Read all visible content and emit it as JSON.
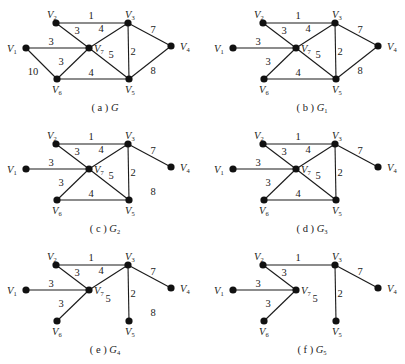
{
  "figure": {
    "vertices_local": {
      "V1": [
        26,
        48
      ],
      "V2": [
        56,
        23
      ],
      "V3": [
        128,
        23
      ],
      "V4": [
        171,
        46
      ],
      "V5": [
        129,
        79
      ],
      "V6": [
        57,
        79
      ],
      "V7": [
        89,
        48
      ]
    },
    "vertex_labels": {
      "V1": {
        "main": "V",
        "sub": "1",
        "dx": -19,
        "dy": 4
      },
      "V2": {
        "main": "V",
        "sub": "2",
        "dx": -9,
        "dy": -5
      },
      "V3": {
        "main": "V",
        "sub": "3",
        "dx": -3,
        "dy": -5
      },
      "V4": {
        "main": "V",
        "sub": "4",
        "dx": 9,
        "dy": 4
      },
      "V5": {
        "main": "V",
        "sub": "5",
        "dx": -4,
        "dy": 14
      },
      "V6": {
        "main": "V",
        "sub": "6",
        "dx": -5,
        "dy": 14
      },
      "V7": {
        "main": "V",
        "sub": "7",
        "dx": 5,
        "dy": 4
      }
    },
    "panels": [
      {
        "id": "a",
        "caption_prefix": "( a ) ",
        "caption_name": "G",
        "caption_sub": "",
        "offset": [
          0,
          0
        ],
        "caption_pos": [
          105,
          111
        ],
        "edges": [
          {
            "u": "V2",
            "v": "V3",
            "w": "1",
            "lx": 91,
            "ly": 19
          },
          {
            "u": "V2",
            "v": "V7",
            "w": "3",
            "lx": 77,
            "ly": 34
          },
          {
            "u": "V7",
            "v": "V3",
            "w": "4",
            "lx": 101,
            "ly": 32
          },
          {
            "u": "V1",
            "v": "V7",
            "w": "3",
            "lx": 51,
            "ly": 45
          },
          {
            "u": "V7",
            "v": "V5",
            "w": "5",
            "lx": 111,
            "ly": 58
          },
          {
            "u": "V3",
            "v": "V5",
            "w": "2",
            "lx": 133,
            "ly": 55
          },
          {
            "u": "V3",
            "v": "V4",
            "w": "7",
            "lx": 153,
            "ly": 33
          },
          {
            "u": "V4",
            "v": "V5",
            "w": "8",
            "lx": 153,
            "ly": 74
          },
          {
            "u": "V6",
            "v": "V7",
            "w": "3",
            "lx": 61,
            "ly": 65
          },
          {
            "u": "V6",
            "v": "V5",
            "w": "4",
            "lx": 91,
            "ly": 76
          },
          {
            "u": "V1",
            "v": "V6",
            "w": "10",
            "lx": 33,
            "ly": 75
          }
        ],
        "floating_labels": []
      },
      {
        "id": "b",
        "caption_prefix": "( b ) ",
        "caption_name": "G",
        "caption_sub": "1",
        "offset": [
          207,
          0
        ],
        "caption_pos": [
          105,
          111
        ],
        "edges": [
          {
            "u": "V2",
            "v": "V3",
            "w": "1",
            "lx": 91,
            "ly": 19
          },
          {
            "u": "V2",
            "v": "V7",
            "w": "3",
            "lx": 77,
            "ly": 34
          },
          {
            "u": "V7",
            "v": "V3",
            "w": "4",
            "lx": 101,
            "ly": 32
          },
          {
            "u": "V1",
            "v": "V7",
            "w": "3",
            "lx": 51,
            "ly": 45
          },
          {
            "u": "V7",
            "v": "V5",
            "w": "5",
            "lx": 111,
            "ly": 58
          },
          {
            "u": "V3",
            "v": "V5",
            "w": "2",
            "lx": 133,
            "ly": 55
          },
          {
            "u": "V3",
            "v": "V4",
            "w": "7",
            "lx": 153,
            "ly": 33
          },
          {
            "u": "V4",
            "v": "V5",
            "w": "8",
            "lx": 153,
            "ly": 74
          },
          {
            "u": "V6",
            "v": "V7",
            "w": "3",
            "lx": 61,
            "ly": 65
          },
          {
            "u": "V6",
            "v": "V5",
            "w": "4",
            "lx": 91,
            "ly": 76
          }
        ],
        "floating_labels": []
      },
      {
        "id": "c",
        "caption_prefix": "( c ) ",
        "caption_name": "G",
        "caption_sub": "2",
        "offset": [
          0,
          121
        ],
        "caption_pos": [
          105,
          111
        ],
        "edges": [
          {
            "u": "V2",
            "v": "V3",
            "w": "1",
            "lx": 91,
            "ly": 19
          },
          {
            "u": "V2",
            "v": "V7",
            "w": "3",
            "lx": 77,
            "ly": 34
          },
          {
            "u": "V7",
            "v": "V3",
            "w": "4",
            "lx": 101,
            "ly": 32
          },
          {
            "u": "V1",
            "v": "V7",
            "w": "3",
            "lx": 51,
            "ly": 45
          },
          {
            "u": "V7",
            "v": "V5",
            "w": "5",
            "lx": 111,
            "ly": 58
          },
          {
            "u": "V3",
            "v": "V5",
            "w": "2",
            "lx": 133,
            "ly": 55
          },
          {
            "u": "V3",
            "v": "V4",
            "w": "7",
            "lx": 153,
            "ly": 33
          },
          {
            "u": "V6",
            "v": "V7",
            "w": "3",
            "lx": 61,
            "ly": 65
          },
          {
            "u": "V6",
            "v": "V5",
            "w": "4",
            "lx": 91,
            "ly": 76
          }
        ],
        "floating_labels": [
          {
            "text": "8",
            "lx": 153,
            "ly": 74
          }
        ]
      },
      {
        "id": "d",
        "caption_prefix": "( d ) ",
        "caption_name": "G",
        "caption_sub": "3",
        "offset": [
          207,
          121
        ],
        "caption_pos": [
          105,
          111
        ],
        "edges": [
          {
            "u": "V2",
            "v": "V3",
            "w": "1",
            "lx": 91,
            "ly": 19
          },
          {
            "u": "V2",
            "v": "V7",
            "w": "3",
            "lx": 77,
            "ly": 34
          },
          {
            "u": "V7",
            "v": "V3",
            "w": "4",
            "lx": 101,
            "ly": 32
          },
          {
            "u": "V1",
            "v": "V7",
            "w": "3",
            "lx": 51,
            "ly": 45
          },
          {
            "u": "V7",
            "v": "V5",
            "w": "5",
            "lx": 111,
            "ly": 58
          },
          {
            "u": "V3",
            "v": "V5",
            "w": "2",
            "lx": 133,
            "ly": 55
          },
          {
            "u": "V3",
            "v": "V4",
            "w": "7",
            "lx": 153,
            "ly": 33
          },
          {
            "u": "V6",
            "v": "V7",
            "w": "3",
            "lx": 61,
            "ly": 65
          },
          {
            "u": "V6",
            "v": "V5",
            "w": "4",
            "lx": 91,
            "ly": 76
          }
        ],
        "floating_labels": []
      },
      {
        "id": "e",
        "caption_prefix": "( e ) ",
        "caption_name": "G",
        "caption_sub": "4",
        "offset": [
          0,
          242
        ],
        "caption_pos": [
          105,
          111
        ],
        "edges": [
          {
            "u": "V2",
            "v": "V3",
            "w": "1",
            "lx": 91,
            "ly": 19
          },
          {
            "u": "V2",
            "v": "V7",
            "w": "3",
            "lx": 77,
            "ly": 34
          },
          {
            "u": "V7",
            "v": "V3",
            "w": "4",
            "lx": 101,
            "ly": 32
          },
          {
            "u": "V1",
            "v": "V7",
            "w": "3",
            "lx": 51,
            "ly": 45
          },
          {
            "u": "V3",
            "v": "V5",
            "w": "2",
            "lx": 133,
            "ly": 55
          },
          {
            "u": "V3",
            "v": "V4",
            "w": "7",
            "lx": 153,
            "ly": 33
          },
          {
            "u": "V6",
            "v": "V7",
            "w": "3",
            "lx": 61,
            "ly": 65
          }
        ],
        "floating_labels": [
          {
            "text": "5",
            "lx": 108,
            "ly": 60
          },
          {
            "text": "8",
            "lx": 153,
            "ly": 74
          }
        ]
      },
      {
        "id": "f",
        "caption_prefix": "( f ) ",
        "caption_name": "G",
        "caption_sub": "5",
        "offset": [
          207,
          242
        ],
        "caption_pos": [
          105,
          111
        ],
        "edges": [
          {
            "u": "V2",
            "v": "V3",
            "w": "1",
            "lx": 91,
            "ly": 19
          },
          {
            "u": "V2",
            "v": "V7",
            "w": "3",
            "lx": 77,
            "ly": 34
          },
          {
            "u": "V1",
            "v": "V7",
            "w": "3",
            "lx": 51,
            "ly": 45
          },
          {
            "u": "V3",
            "v": "V5",
            "w": "2",
            "lx": 133,
            "ly": 55
          },
          {
            "u": "V3",
            "v": "V4",
            "w": "7",
            "lx": 153,
            "ly": 33
          },
          {
            "u": "V6",
            "v": "V7",
            "w": "3",
            "lx": 61,
            "ly": 65
          }
        ],
        "floating_labels": [
          {
            "text": "5",
            "lx": 108,
            "ly": 60
          }
        ]
      }
    ]
  }
}
